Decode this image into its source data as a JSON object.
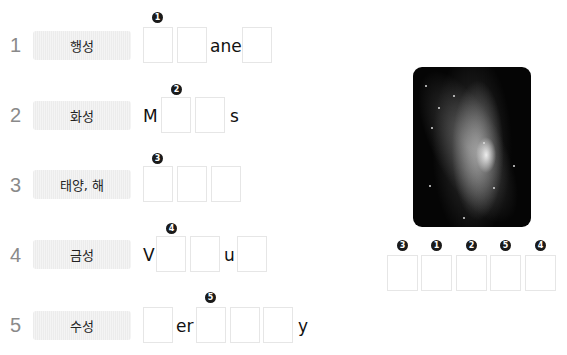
{
  "rows": [
    {
      "number": "1",
      "label": "행성",
      "word_parts": [
        "ane"
      ],
      "badge": "1"
    },
    {
      "number": "2",
      "label": "화성",
      "word_parts": [
        "M",
        "s"
      ],
      "badge": "2"
    },
    {
      "number": "3",
      "label": "태양, 해",
      "word_parts": [],
      "badge": "3"
    },
    {
      "number": "4",
      "label": "금성",
      "word_parts": [
        "V",
        "u"
      ],
      "badge": "4"
    },
    {
      "number": "5",
      "label": "수성",
      "word_parts": [
        "er",
        "y"
      ],
      "badge": "5"
    }
  ],
  "answer": {
    "badges": [
      "3",
      "1",
      "2",
      "5",
      "4"
    ]
  },
  "image": {
    "icon": "galaxy-photo"
  }
}
